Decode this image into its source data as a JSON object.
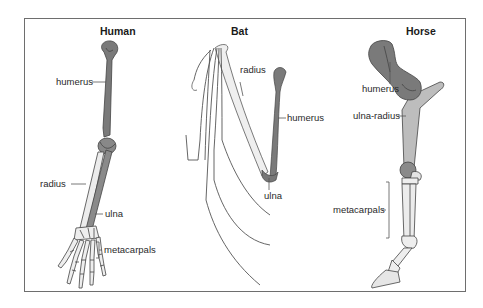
{
  "diagram": {
    "panels": [
      {
        "title": "Human",
        "labels": {
          "humerus": "humerus",
          "radius": "radius",
          "ulna": "ulna",
          "metacarpals": "metacarpals"
        }
      },
      {
        "title": "Bat",
        "labels": {
          "radius": "radius",
          "humerus": "humerus",
          "ulna": "ulna"
        }
      },
      {
        "title": "Horse",
        "labels": {
          "humerus": "humerus",
          "ulna_radius": "ulna-radius",
          "metacarpals": "metacarpals"
        }
      }
    ],
    "colors": {
      "humerus": "#7a7a7a",
      "ulna": "#8c8c8c",
      "radius": "#e6e6e6",
      "bone_outline": "#444444",
      "frame": "#6e6e6e",
      "leader": "#555555"
    }
  }
}
